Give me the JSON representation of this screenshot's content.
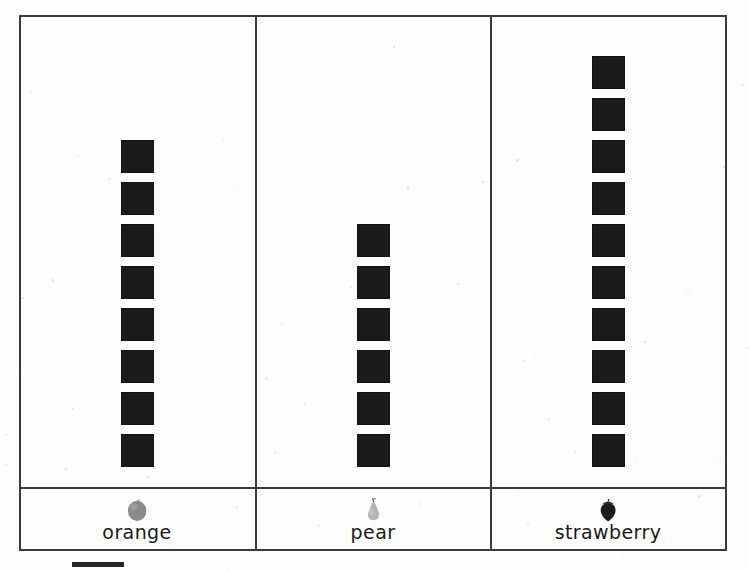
{
  "document": {
    "type": "pictograph-worksheet",
    "background_color": "#fdfdfd",
    "frame_color": "#3a3a3a"
  },
  "chart_data": {
    "type": "bar",
    "chart_style": "pictograph",
    "title": "",
    "subtitle": "",
    "xlabel": "",
    "ylabel": "",
    "categories": [
      "orange",
      "pear",
      "strawberry"
    ],
    "values": [
      8,
      6,
      10
    ],
    "ylim": [
      0,
      11
    ],
    "grid": false,
    "legend_position": "below-left",
    "orientation": "vertical",
    "symbol": "black-square",
    "symbol_color": "#1b1b1b",
    "symbol_size_px": 33,
    "symbol_pitch_px": 42,
    "series": [
      {
        "name": "count",
        "values": [
          8,
          6,
          10
        ]
      }
    ],
    "annotations": [],
    "tick_labels": [
      "orange",
      "pear",
      "strawberry"
    ]
  },
  "columns": [
    {
      "id": "orange",
      "label": "orange",
      "count": 8,
      "icon": "orange-fruit-icon",
      "icon_color": "#8a8a8a"
    },
    {
      "id": "pear",
      "label": "pear",
      "count": 6,
      "icon": "pear-fruit-icon",
      "icon_color": "#b5b5b5"
    },
    {
      "id": "strawberry",
      "label": "strawberry",
      "count": 10,
      "icon": "strawberry-fruit-icon",
      "icon_color": "#1c1c1c"
    }
  ],
  "legend": {
    "key_color": "#262626",
    "key_label": ""
  }
}
